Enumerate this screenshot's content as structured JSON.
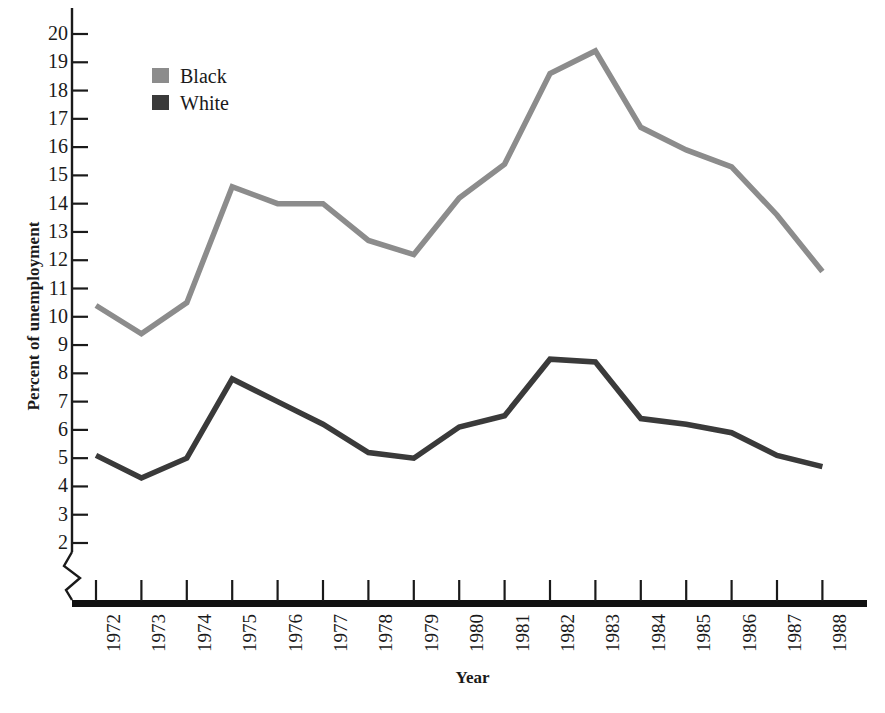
{
  "chart_data": {
    "type": "line",
    "title": "",
    "xlabel": "Year",
    "ylabel": "Percent of unemployment",
    "categories": [
      "1972",
      "1973",
      "1974",
      "1975",
      "1976",
      "1977",
      "1978",
      "1979",
      "1980",
      "1981",
      "1982",
      "1983",
      "1984",
      "1985",
      "1986",
      "1987",
      "1988"
    ],
    "x": [
      1972,
      1973,
      1974,
      1975,
      1976,
      1977,
      1978,
      1979,
      1980,
      1981,
      1982,
      1983,
      1984,
      1985,
      1986,
      1987,
      1988
    ],
    "series": [
      {
        "name": "Black",
        "color": "#8c8c8c",
        "values": [
          10.4,
          9.4,
          10.5,
          14.6,
          14.0,
          14.0,
          12.7,
          12.2,
          14.2,
          15.4,
          18.6,
          19.4,
          16.7,
          15.9,
          15.3,
          13.6,
          11.6
        ]
      },
      {
        "name": "White",
        "color": "#3a3a3a",
        "values": [
          5.1,
          4.3,
          5.0,
          7.8,
          7.0,
          6.2,
          5.2,
          5.0,
          6.1,
          6.5,
          8.5,
          8.4,
          6.4,
          6.2,
          5.9,
          5.1,
          4.7
        ]
      }
    ],
    "ylim": [
      1.5,
      20.6
    ],
    "ytick_values": [
      2,
      3,
      4,
      5,
      6,
      7,
      8,
      9,
      10,
      11,
      12,
      13,
      14,
      15,
      16,
      17,
      18,
      19,
      20
    ],
    "ytick_labels": [
      "2",
      "3",
      "4",
      "5",
      "6",
      "7",
      "8",
      "9",
      "10",
      "11",
      "12",
      "13",
      "14",
      "15",
      "16",
      "17",
      "18",
      "19",
      "20"
    ],
    "y_axis_break": true,
    "grid": false,
    "legend_position": "top-left"
  },
  "legend": {
    "items": [
      {
        "label": "Black",
        "color": "#8c8c8c"
      },
      {
        "label": "White",
        "color": "#3a3a3a"
      }
    ]
  },
  "axes": {
    "y_title": "Percent of unemployment",
    "x_title": "Year"
  }
}
